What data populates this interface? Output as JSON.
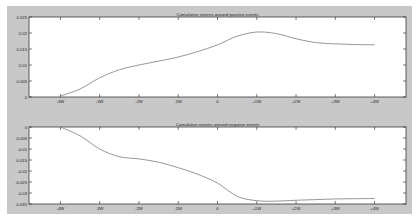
{
  "chart_data": [
    {
      "type": "line",
      "title": "Cumulative returns around positive events",
      "xlabel": "",
      "ylabel": "",
      "x_ticks": [
        "-4W",
        "-3W",
        "-2W",
        "-1W",
        "0",
        "+1W",
        "+2W",
        "+3W",
        "+4W"
      ],
      "y_ticks": [
        "0",
        "0.005",
        "0.01",
        "0.015",
        "0.02",
        "0.025"
      ],
      "ylim": [
        0,
        0.025
      ],
      "grid": false,
      "x": [
        -4,
        -3.5,
        -3,
        -2.5,
        -2,
        -1.5,
        -1,
        -0.5,
        0,
        0.5,
        1,
        1.5,
        2,
        2.5,
        3,
        3.5,
        4
      ],
      "series": [
        {
          "name": "Cumulative returns (positive events)",
          "values": [
            0.0003,
            0.0025,
            0.006,
            0.0085,
            0.01,
            0.0112,
            0.0125,
            0.0142,
            0.0163,
            0.019,
            0.0203,
            0.0198,
            0.0182,
            0.017,
            0.0166,
            0.0164,
            0.0163
          ]
        }
      ]
    },
    {
      "type": "line",
      "title": "Cumulative returns around negative events",
      "xlabel": "",
      "ylabel": "",
      "x_ticks": [
        "-4W",
        "-3W",
        "-2W",
        "-1W",
        "0",
        "+1W",
        "+2W",
        "+3W",
        "+4W"
      ],
      "y_ticks": [
        "0",
        "-0.005",
        "-0.01",
        "-0.015",
        "-0.02",
        "-0.025",
        "-0.03",
        "-0.035"
      ],
      "ylim": [
        -0.035,
        0
      ],
      "grid": false,
      "x": [
        -4,
        -3.5,
        -3,
        -2.5,
        -2,
        -1.5,
        -1,
        -0.5,
        0,
        0.5,
        1,
        1.5,
        2,
        2.5,
        3,
        3.5,
        4
      ],
      "series": [
        {
          "name": "Cumulative returns (negative events)",
          "values": [
            0.0,
            -0.004,
            -0.01,
            -0.0135,
            -0.0145,
            -0.016,
            -0.0185,
            -0.0215,
            -0.0255,
            -0.0315,
            -0.0335,
            -0.0337,
            -0.0333,
            -0.033,
            -0.0327,
            -0.0326,
            -0.0325
          ]
        }
      ]
    }
  ],
  "colors": {
    "figure_bg": "#c8c8c8",
    "axes_bg": "#ffffff",
    "line": "#8a8a8a",
    "axis": "#222222"
  }
}
